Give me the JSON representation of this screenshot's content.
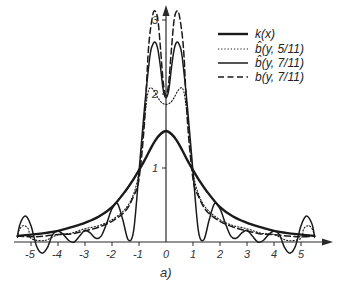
{
  "chart_data": {
    "type": "line",
    "title": "",
    "subtitle_label": "a)",
    "xlabel": "",
    "ylabel": "",
    "xlim": [
      -5.6,
      5.9
    ],
    "ylim": [
      -0.2,
      3.2
    ],
    "grid": false,
    "legend_position": "upper right",
    "x_ticks": [
      -5,
      -4,
      -3,
      -2,
      -1,
      0,
      1,
      2,
      3,
      4,
      5
    ],
    "x_tick_labels": [
      "-5",
      "-4",
      "-3",
      "-2",
      "-1",
      "0",
      "1",
      "2",
      "3",
      "4",
      "5"
    ],
    "y_ticks": [
      1,
      2,
      3
    ],
    "y_tick_labels": [
      "1",
      "2",
      "3"
    ],
    "series": [
      {
        "name": "k(x)",
        "style": "solid-thick",
        "x": [
          -5.5,
          -5,
          -4.5,
          -4,
          -3.5,
          -3,
          -2.5,
          -2,
          -1.5,
          -1.2,
          -1,
          -0.8,
          -0.6,
          -0.4,
          -0.2,
          0,
          0.2,
          0.4,
          0.6,
          0.8,
          1,
          1.2,
          1.5,
          2,
          2.5,
          3,
          3.5,
          4,
          4.5,
          5,
          5.5
        ],
        "y": [
          0.08,
          0.1,
          0.12,
          0.15,
          0.2,
          0.26,
          0.34,
          0.47,
          0.69,
          0.85,
          0.97,
          1.1,
          1.24,
          1.37,
          1.46,
          1.5,
          1.46,
          1.37,
          1.24,
          1.1,
          0.97,
          0.85,
          0.69,
          0.47,
          0.34,
          0.26,
          0.2,
          0.15,
          0.12,
          0.1,
          0.08
        ]
      },
      {
        "name": "b̂(y, 5/11)",
        "style": "dotted",
        "x": [
          -5.5,
          -5.45,
          -5.3,
          -5.1,
          -5,
          -4.5,
          -4,
          -3.5,
          -3,
          -2.5,
          -2,
          -1.5,
          -1.2,
          -1,
          -0.85,
          -0.7,
          -0.6,
          -0.45,
          -0.3,
          -0.15,
          0,
          0.15,
          0.3,
          0.45,
          0.6,
          0.7,
          0.85,
          1,
          1.2,
          1.5,
          2,
          2.5,
          3,
          3.5,
          4,
          4.5,
          5,
          5.1,
          5.3,
          5.45,
          5.5
        ],
        "y": [
          0.06,
          0.15,
          0.22,
          0.18,
          0.05,
          0.02,
          0.1,
          0.12,
          0.18,
          0.22,
          0.3,
          0.45,
          0.65,
          0.95,
          1.5,
          1.95,
          2.08,
          2.05,
          1.95,
          1.88,
          1.86,
          1.88,
          1.95,
          2.05,
          2.08,
          1.95,
          1.5,
          0.95,
          0.65,
          0.45,
          0.3,
          0.22,
          0.18,
          0.12,
          0.1,
          0.02,
          0.05,
          0.18,
          0.22,
          0.15,
          0.06
        ]
      },
      {
        "name": "b̂(y, 7/11)",
        "style": "solid-thin",
        "x": [
          -5.5,
          -5.4,
          -5.2,
          -5,
          -4.8,
          -4.6,
          -4.4,
          -4.2,
          -4,
          -3.8,
          -3.6,
          -3.4,
          -3.2,
          -3,
          -2.8,
          -2.6,
          -2.4,
          -2.2,
          -2,
          -1.8,
          -1.6,
          -1.4,
          -1.2,
          -1,
          -0.8,
          -0.6,
          -0.5,
          -0.4,
          -0.3,
          -0.2,
          -0.1,
          0,
          0.1,
          0.2,
          0.3,
          0.4,
          0.5,
          0.6,
          0.8,
          1,
          1.2,
          1.4,
          1.6,
          1.8,
          2,
          2.2,
          2.4,
          2.6,
          2.8,
          3,
          3.2,
          3.4,
          3.6,
          3.8,
          4,
          4.2,
          4.4,
          4.6,
          4.8,
          5,
          5.2,
          5.4,
          5.5
        ],
        "y": [
          0.08,
          0.25,
          0.35,
          0.22,
          -0.05,
          -0.15,
          -0.08,
          0.1,
          0.15,
          0.1,
          0.02,
          0.0,
          0.08,
          0.16,
          0.12,
          0.05,
          0.08,
          0.25,
          0.45,
          0.52,
          0.3,
          0.03,
          0.15,
          0.95,
          1.8,
          2.5,
          2.66,
          2.7,
          2.6,
          2.35,
          2.05,
          1.95,
          2.05,
          2.35,
          2.6,
          2.7,
          2.66,
          2.5,
          1.8,
          0.95,
          0.15,
          0.03,
          0.3,
          0.52,
          0.45,
          0.25,
          0.08,
          0.05,
          0.12,
          0.16,
          0.08,
          0.0,
          0.02,
          0.1,
          0.15,
          0.1,
          -0.08,
          -0.15,
          -0.05,
          0.22,
          0.35,
          0.25,
          0.08
        ]
      },
      {
        "name": "b(y, 7/11)",
        "style": "dashed",
        "x": [
          -5.5,
          -5,
          -4.5,
          -4,
          -3.5,
          -3,
          -2.5,
          -2,
          -1.5,
          -1.2,
          -1,
          -0.8,
          -0.65,
          -0.5,
          -0.4,
          -0.3,
          -0.2,
          -0.1,
          0,
          0.1,
          0.2,
          0.3,
          0.4,
          0.5,
          0.65,
          0.8,
          1,
          1.2,
          1.5,
          2,
          2.5,
          3,
          3.5,
          4,
          4.5,
          5,
          5.5
        ],
        "y": [
          0.08,
          0.07,
          0.08,
          0.1,
          0.11,
          0.15,
          0.2,
          0.28,
          0.42,
          0.62,
          0.85,
          1.6,
          2.6,
          3.05,
          3.12,
          3.0,
          2.6,
          2.15,
          1.98,
          2.15,
          2.6,
          3.0,
          3.12,
          3.05,
          2.6,
          1.6,
          0.85,
          0.62,
          0.42,
          0.28,
          0.2,
          0.15,
          0.11,
          0.1,
          0.08,
          0.07,
          0.08
        ]
      }
    ]
  },
  "legend": {
    "items": [
      {
        "label": "k(x)",
        "style": "solid-thick"
      },
      {
        "label": "b̂(y, 5/11)",
        "style": "dotted"
      },
      {
        "label": "b̂(y, 7/11)",
        "style": "solid-thin"
      },
      {
        "label": "b(y, 7/11)",
        "style": "dashed"
      }
    ]
  },
  "colors": {
    "line": "#1a1a1a",
    "axis": "#2a2a2a",
    "text": "#333333",
    "background": "#ffffff"
  }
}
